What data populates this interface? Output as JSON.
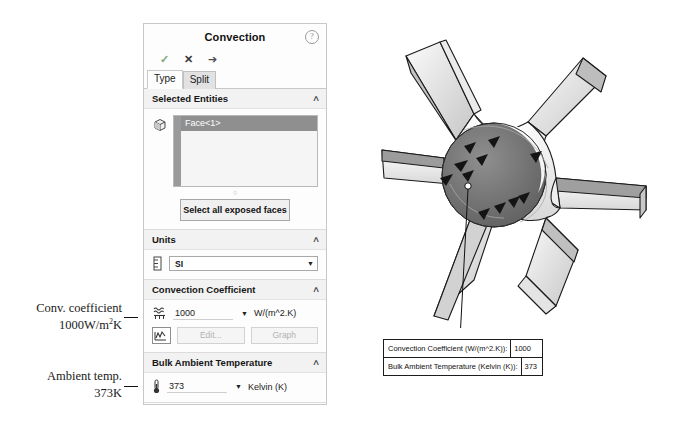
{
  "annotations": {
    "conv_line1": "Conv. coefficient",
    "conv_line2_pre": "1000W/m",
    "conv_line2_sup": "2",
    "conv_line2_post": "K",
    "ambient_line1": "Ambient temp.",
    "ambient_line2": "373K"
  },
  "panel": {
    "title": "Convection",
    "help_icon": "?",
    "toolbar": {
      "accept_icon": "✓",
      "cancel_icon": "✕",
      "pin_icon": "➔"
    },
    "tabs": [
      {
        "label": "Type",
        "active": true
      },
      {
        "label": "Split",
        "active": false
      }
    ],
    "selected_entities": {
      "title": "Selected Entities",
      "collapse_icon": "∧",
      "entity_icon": "face-cube-icon",
      "items": [
        "Face<1>"
      ],
      "select_all_button": "Select all exposed faces"
    },
    "units": {
      "title": "Units",
      "collapse_icon": "∧",
      "icon": "units-ruler-icon",
      "value": "SI",
      "caret": "▼"
    },
    "convection_coefficient": {
      "title": "Convection Coefficient",
      "collapse_icon": "∧",
      "icon": "convection-icon",
      "value": "1000",
      "caret": "▼",
      "unit": "W/(m^2.K)",
      "graph_icon": "curve-icon",
      "edit_button": "Edit...",
      "graph_button": "Graph"
    },
    "bulk_ambient_temperature": {
      "title": "Bulk Ambient Temperature",
      "collapse_icon": "∧",
      "icon": "thermometer-icon",
      "value": "373",
      "caret": "▼",
      "unit": "Kelvin (K)"
    }
  },
  "callout_table": {
    "rows": [
      {
        "label": "Convection Coefficient (W/(m^2.K)):",
        "value": "1000"
      },
      {
        "label": "Bulk Ambient Temperature (Kelvin (K)):",
        "value": "373"
      }
    ]
  },
  "model": {
    "name": "six-blade-impeller",
    "bore_markers": "convection-arrow-markers"
  }
}
